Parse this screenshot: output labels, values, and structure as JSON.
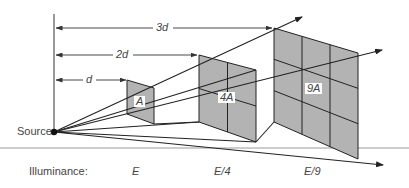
{
  "diagram": {
    "source_label": "Source",
    "distance_labels": [
      "d",
      "2d",
      "3d"
    ],
    "area_labels": [
      "A",
      "4A",
      "9A"
    ],
    "illuminance_label": "Illuminance:",
    "illuminance_values": [
      "E",
      "E/4",
      "E/9"
    ],
    "colors": {
      "panel_fill": "#b3b3b3",
      "line": "#222222",
      "dim_line": "#555555",
      "baseline": "#999999",
      "text": "#444444"
    }
  }
}
